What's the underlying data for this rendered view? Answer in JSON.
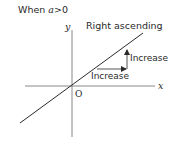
{
  "diagram": {
    "condition_prefix": "When ",
    "condition_var": "a",
    "condition_rest": ">0",
    "y_axis_label": "y",
    "x_axis_label": "x",
    "origin_label": "O",
    "line_label": "Right ascending",
    "vertical_change_label": "Increase",
    "horizontal_change_label": "Increase",
    "colors": {
      "line": "#2a2a2a",
      "axes": "#7a7a7a",
      "text": "#2a2a2a"
    }
  }
}
